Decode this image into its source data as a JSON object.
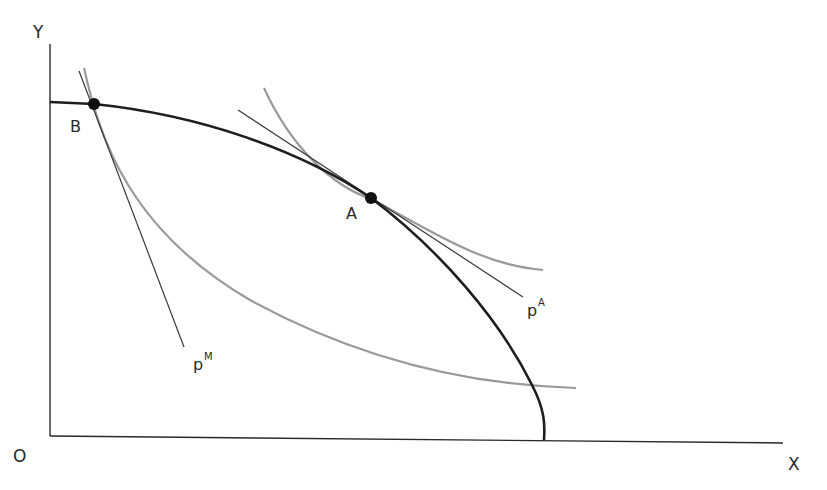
{
  "diagram": {
    "type": "economics-trade-diagram",
    "axes": {
      "origin_label": "O",
      "x_label": "X",
      "y_label": "Y"
    },
    "points": {
      "autarky": {
        "label": "A"
      },
      "trade": {
        "label": "B"
      }
    },
    "price_lines": {
      "autarky": {
        "label": "p",
        "superscript": "A"
      },
      "market": {
        "label": "p",
        "superscript": "M"
      }
    },
    "curves": {
      "ppf": {
        "description": "production possibility frontier",
        "color": "#1e1e1e"
      },
      "indifference_high": {
        "description": "indifference curve tangent at A",
        "color": "#9a9a9a"
      },
      "indifference_low": {
        "description": "indifference curve through B",
        "color": "#9a9a9a"
      }
    },
    "colors": {
      "axis": "#2a2a2a",
      "ppf": "#1e1e1e",
      "indifference": "#9a9a9a",
      "price_line": "#3a3a3a",
      "point": "#111111"
    }
  }
}
